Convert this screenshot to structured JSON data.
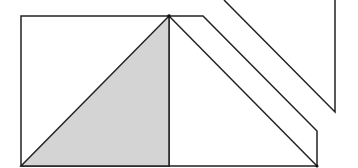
{
  "diagram": {
    "colors": {
      "background": "#ffffff",
      "stroke": "#222222",
      "shade": "#d4d4d4"
    },
    "shapes": {
      "square": {
        "x": 21,
        "y": 16,
        "width": 148,
        "height": 150
      },
      "shaded_triangle": {
        "points": "21,166 169,16 169,166"
      },
      "strip": {
        "points": "169,16 203,16 317,131 317,166 169,166"
      },
      "strip_inner_diagonal": {
        "x1": 169,
        "y1": 16,
        "x2": 317,
        "y2": 166
      },
      "detached_piece": {
        "points": "224,0 335,112 335,0"
      }
    }
  }
}
